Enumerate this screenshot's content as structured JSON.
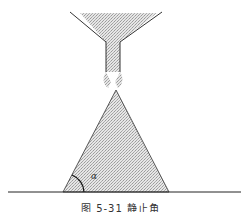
{
  "figure": {
    "caption": "图 5-31   静止角",
    "angle_label": "α"
  },
  "colors": {
    "line": "#333333",
    "fill": "#c8c8c8",
    "background": "#ffffff"
  }
}
